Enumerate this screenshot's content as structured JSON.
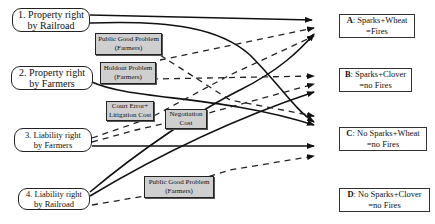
{
  "rights": [
    {
      "line1": "1. Property right",
      "line2": "by Railroad"
    },
    {
      "line1": "2. Property right",
      "line2": "by Farmers"
    },
    {
      "line1": "3. Liability right",
      "line2": "by Farmers"
    },
    {
      "line1": "4. Liability right",
      "line2": "by Railroad"
    }
  ],
  "outcomes": [
    {
      "letter": "A",
      "line1": ": Sparks+Wheat",
      "line2": "=Fires"
    },
    {
      "letter": "B",
      "line1": ": Sparks+Clover",
      "line2": "=no Fires"
    },
    {
      "letter": "C",
      "line1": ": No Sparks+Wheat",
      "line2": "=no Fires"
    },
    {
      "letter": "D",
      "line1": ": No Sparks+Clover",
      "line2": "=no Fires"
    }
  ],
  "costs": [
    {
      "line1": "Public Good Problem",
      "line2": "(Farmers)"
    },
    {
      "line1": "Holdout Problem",
      "line2": "(Farmers)"
    },
    {
      "line1": "Court Error+",
      "line2": "Litigation Cost"
    },
    {
      "line1": "Negotiation",
      "line2": "Cost"
    },
    {
      "line1": "Public Good Problem",
      "line2": "(Farmers)"
    }
  ],
  "legend": {
    "solid": "low transaction cost path",
    "dashed": "high transaction cost path"
  }
}
